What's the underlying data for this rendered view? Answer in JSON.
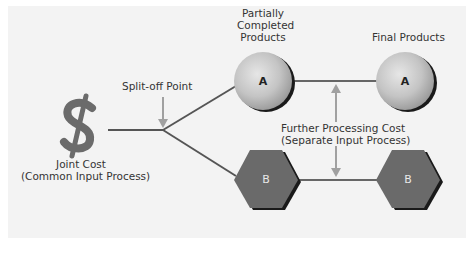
{
  "diagram": {
    "joint_cost": {
      "icon": "dollar-sign-icon",
      "label_line1": "Joint Cost",
      "label_line2": "(Common Input Process)"
    },
    "split_off": {
      "label": "Split-off Point"
    },
    "columns": {
      "partial_line1": "Partially",
      "partial_line2": "Completed",
      "partial_line3": "Products",
      "final": "Final Products"
    },
    "further_processing": {
      "label_line1": "Further Processing Cost",
      "label_line2": "(Separate Input Process)"
    },
    "products": {
      "a_partial": "A",
      "a_final": "A",
      "b_partial": "B",
      "b_final": "B"
    },
    "colors": {
      "background": "#f3f3f3",
      "line": "#555555",
      "arrow": "#a0a0a0",
      "sphere": "#c8c8c8",
      "hexagon": "#6a6a6a",
      "dollar": "#6b6b6b",
      "text": "#333333"
    }
  }
}
